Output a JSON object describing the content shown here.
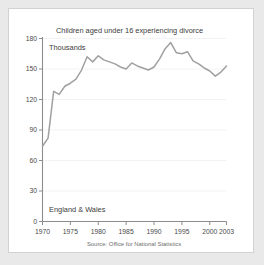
{
  "figure": {
    "background": "#ffffff",
    "outer_background": "#e9e9e9",
    "border_color": "#d2d2d2"
  },
  "chart_data": {
    "type": "line",
    "title": "Children aged under 16 experiencing divorce",
    "unit_label": "Thousands",
    "region_label": "England & Wales",
    "source": "Source: Office for National Statistics",
    "xlabel": "",
    "ylabel": "",
    "xlim": [
      1970,
      2003
    ],
    "ylim": [
      0,
      180
    ],
    "grid": true,
    "legend": "none",
    "line_color": "#a0a0a0",
    "xticks": [
      1970,
      1975,
      1980,
      1985,
      1990,
      1995,
      2000,
      2003
    ],
    "xtick_labels": [
      "1970",
      "1975",
      "1980",
      "1985",
      "1990",
      "1995",
      "2000",
      "2003"
    ],
    "yticks": [
      0,
      30,
      60,
      90,
      120,
      150,
      180
    ],
    "ytick_labels": [
      "0",
      "30",
      "60",
      "90",
      "120",
      "150",
      "180"
    ],
    "x": [
      1970,
      1971,
      1972,
      1973,
      1974,
      1975,
      1976,
      1977,
      1978,
      1979,
      1980,
      1981,
      1982,
      1983,
      1984,
      1985,
      1986,
      1987,
      1988,
      1989,
      1990,
      1991,
      1992,
      1993,
      1994,
      1995,
      1996,
      1997,
      1998,
      1999,
      2000,
      2001,
      2002,
      2003
    ],
    "values": [
      74,
      82,
      128,
      125,
      133,
      136,
      140,
      149,
      162,
      157,
      163,
      159,
      157,
      155,
      152,
      150,
      156,
      153,
      151,
      149,
      152,
      160,
      170,
      176,
      166,
      165,
      167,
      158,
      155,
      151,
      148,
      143,
      147,
      153
    ],
    "series": [
      {
        "name": "Children aged under 16 experiencing divorce",
        "values": [
          74,
          82,
          128,
          125,
          133,
          136,
          140,
          149,
          162,
          157,
          163,
          159,
          157,
          155,
          152,
          150,
          156,
          153,
          151,
          149,
          152,
          160,
          170,
          176,
          166,
          165,
          167,
          158,
          155,
          151,
          148,
          143,
          147,
          153
        ]
      }
    ],
    "annotations": [
      {
        "text": "Thousands",
        "position": "top-left-inside-plot"
      },
      {
        "text": "England & Wales",
        "position": "bottom-left-inside-plot"
      }
    ]
  }
}
